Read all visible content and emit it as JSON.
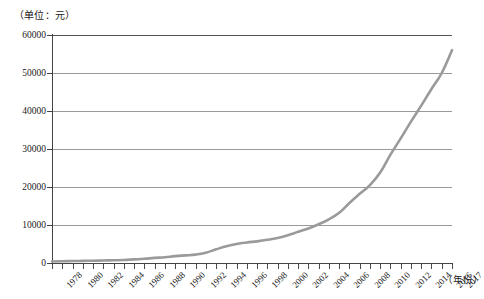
{
  "figure": {
    "unit_caption": "（单位：元）",
    "x_axis_caption": "（年份）",
    "curve_color": "#9a9a9a",
    "gridline_color": "#9a9a9a",
    "axis_color": "#444444",
    "background": "#ffffff"
  },
  "chart_data": {
    "type": "line",
    "title": "",
    "subtitle": "",
    "xlabel": "（年份）",
    "ylabel": "（单位：元）",
    "xlim": [
      1978,
      2017
    ],
    "ylim": [
      0,
      60000
    ],
    "grid": true,
    "legend": null,
    "y_ticks": [
      0,
      10000,
      20000,
      30000,
      40000,
      50000,
      60000
    ],
    "y_tick_labels": [
      "0",
      "10000",
      "20000",
      "30000",
      "40000",
      "50000",
      "60000"
    ],
    "x_tick_labels": [
      "1978",
      "1980",
      "1982",
      "1984",
      "1986",
      "1988",
      "1990",
      "1992",
      "1994",
      "1996",
      "1998",
      "2000",
      "2002",
      "2004",
      "2006",
      "2008",
      "2010",
      "2012",
      "2014",
      "2016",
      "2017"
    ],
    "x_tick_label_years": [
      1978,
      1980,
      1982,
      1984,
      1986,
      1988,
      1990,
      1992,
      1994,
      1996,
      1998,
      2000,
      2002,
      2004,
      2006,
      2008,
      2010,
      2012,
      2014,
      2016,
      2017
    ],
    "x_minor_tick_years": [
      1978,
      1979,
      1980,
      1981,
      1982,
      1983,
      1984,
      1985,
      1986,
      1987,
      1988,
      1989,
      1990,
      1991,
      1992,
      1993,
      1994,
      1995,
      1996,
      1997,
      1998,
      1999,
      2000,
      2001,
      2002,
      2003,
      2004,
      2005,
      2006,
      2007,
      2008,
      2009,
      2010,
      2011,
      2012,
      2013,
      2014,
      2015,
      2016,
      2017
    ],
    "x": [
      1978,
      1979,
      1980,
      1981,
      1982,
      1983,
      1984,
      1985,
      1986,
      1987,
      1988,
      1989,
      1990,
      1991,
      1992,
      1993,
      1994,
      1995,
      1996,
      1997,
      1998,
      1999,
      2000,
      2001,
      2002,
      2003,
      2004,
      2005,
      2006,
      2007,
      2008,
      2009,
      2010,
      2011,
      2012,
      2013,
      2014,
      2015,
      2016,
      2017
    ],
    "series": [
      {
        "name": "",
        "values": [
          343,
          387,
          478,
          500,
          535,
          565,
          660,
          740,
          900,
          1000,
          1180,
          1260,
          1510,
          1700,
          2030,
          2580,
          3500,
          4280,
          4840,
          5160,
          5430,
          5850,
          6280,
          6860,
          7700,
          8470,
          9420,
          10490,
          11760,
          13790,
          15780,
          17175,
          19110,
          22760,
          26960,
          30530,
          34110,
          36190,
          39220,
          42320
        ]
      }
    ],
    "series_display_values": [
      343,
      387,
      478,
      500,
      535,
      565,
      660,
      740,
      900,
      1000,
      1180,
      1260,
      1510,
      1700,
      2030,
      2580,
      3500,
      4280,
      4840,
      5160,
      5430,
      5850,
      6280,
      6860,
      7700,
      8470,
      9420,
      10490,
      11760,
      13790,
      15780,
      17175,
      19110,
      22760,
      26960,
      30530,
      34110,
      36190,
      39220,
      42320
    ],
    "plotted_values": [
      400,
      450,
      520,
      560,
      600,
      650,
      720,
      800,
      950,
      1100,
      1350,
      1500,
      1800,
      2000,
      2200,
      2700,
      3600,
      4400,
      5000,
      5400,
      5700,
      6100,
      6600,
      7300,
      8200,
      9100,
      10200,
      11500,
      13200,
      15800,
      18200,
      20500,
      23800,
      28500,
      32800,
      37200,
      41400,
      45800,
      50000,
      56000
    ]
  }
}
